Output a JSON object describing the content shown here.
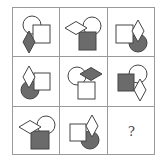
{
  "puzzle": {
    "colors": {
      "outline": "#444444",
      "fill_dark": "#6b6b6b",
      "fill_light": "#ffffff",
      "grid_line": "#9a9a9a"
    },
    "cells": [
      {
        "row": 1,
        "col": 1,
        "shapes": [
          {
            "type": "circle",
            "fill": "white",
            "cx": 19,
            "cy": 17,
            "r": 9
          },
          {
            "type": "square",
            "fill": "white",
            "x": 20,
            "y": 17,
            "w": 17,
            "h": 18
          },
          {
            "type": "diamond",
            "fill": "gray",
            "cx": 16,
            "cy": 34,
            "w": 12,
            "h": 22
          }
        ]
      },
      {
        "row": 1,
        "col": 2,
        "shapes": [
          {
            "type": "circle",
            "fill": "white",
            "cx": 32,
            "cy": 18,
            "r": 9
          },
          {
            "type": "square",
            "fill": "gray",
            "x": 19,
            "y": 24,
            "w": 17,
            "h": 18
          },
          {
            "type": "diamond",
            "fill": "white",
            "cx": 16,
            "cy": 20,
            "w": 22,
            "h": 13
          }
        ]
      },
      {
        "row": 1,
        "col": 3,
        "shapes": [
          {
            "type": "circle",
            "fill": "gray",
            "cx": 30,
            "cy": 35,
            "r": 9
          },
          {
            "type": "square",
            "fill": "white",
            "x": 8,
            "y": 17,
            "w": 17,
            "h": 18
          },
          {
            "type": "diamond",
            "fill": "white",
            "cx": 30,
            "cy": 23,
            "w": 12,
            "h": 22
          }
        ]
      },
      {
        "row": 2,
        "col": 1,
        "shapes": [
          {
            "type": "circle",
            "fill": "gray",
            "cx": 17,
            "cy": 33,
            "r": 9
          },
          {
            "type": "square",
            "fill": "white",
            "x": 21,
            "y": 16,
            "w": 16,
            "h": 17
          },
          {
            "type": "diamond",
            "fill": "white",
            "cx": 16,
            "cy": 20,
            "w": 12,
            "h": 22
          }
        ]
      },
      {
        "row": 2,
        "col": 2,
        "shapes": [
          {
            "type": "circle",
            "fill": "white",
            "cx": 17,
            "cy": 19,
            "r": 9
          },
          {
            "type": "square",
            "fill": "white",
            "x": 18,
            "y": 25,
            "w": 17,
            "h": 17
          },
          {
            "type": "diamond",
            "fill": "gray",
            "cx": 31,
            "cy": 17,
            "w": 22,
            "h": 13
          }
        ]
      },
      {
        "row": 2,
        "col": 3,
        "shapes": [
          {
            "type": "circle",
            "fill": "white",
            "cx": 30,
            "cy": 17,
            "r": 9
          },
          {
            "type": "square",
            "fill": "gray",
            "x": 10,
            "y": 17,
            "w": 16,
            "h": 17
          },
          {
            "type": "diamond",
            "fill": "white",
            "cx": 32,
            "cy": 33,
            "w": 12,
            "h": 22
          }
        ]
      },
      {
        "row": 3,
        "col": 1,
        "shapes": [
          {
            "type": "circle",
            "fill": "white",
            "cx": 33,
            "cy": 18,
            "r": 9
          },
          {
            "type": "square",
            "fill": "gray",
            "x": 18,
            "y": 24,
            "w": 18,
            "h": 18
          },
          {
            "type": "diamond",
            "fill": "white",
            "cx": 17,
            "cy": 20,
            "w": 22,
            "h": 13
          }
        ]
      },
      {
        "row": 3,
        "col": 2,
        "shapes": [
          {
            "type": "circle",
            "fill": "gray",
            "cx": 30,
            "cy": 33,
            "r": 9
          },
          {
            "type": "square",
            "fill": "white",
            "x": 10,
            "y": 17,
            "w": 16,
            "h": 17
          },
          {
            "type": "diamond",
            "fill": "white",
            "cx": 32,
            "cy": 19,
            "w": 12,
            "h": 22
          }
        ]
      },
      {
        "row": 3,
        "col": 3,
        "shapes": [],
        "label": "?"
      }
    ]
  }
}
